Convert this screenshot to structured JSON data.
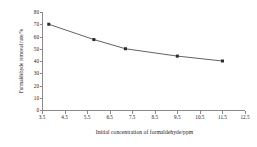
{
  "chart_data": {
    "type": "line",
    "title": "",
    "xlabel": "Initial concentration of formaldehyde/ppm",
    "ylabel": "Formaldehyde removal rate/%",
    "x": [
      3.8,
      5.8,
      7.2,
      9.5,
      11.5
    ],
    "values": [
      70,
      57.5,
      50,
      44,
      40
    ],
    "series": [
      {
        "name": "Formaldehyde removal rate",
        "x": [
          3.8,
          5.8,
          7.2,
          9.5,
          11.5
        ],
        "values": [
          70,
          57.5,
          50,
          44,
          40
        ]
      }
    ],
    "xlim": [
      3.5,
      12.5
    ],
    "ylim": [
      0,
      80
    ],
    "xticks": [
      "3.5",
      "4.5",
      "5.5",
      "6.5",
      "7.5",
      "8.5",
      "9.5",
      "10.5",
      "11.5",
      "12.5"
    ],
    "xtick_values": [
      3.5,
      4.5,
      5.5,
      6.5,
      7.5,
      8.5,
      9.5,
      10.5,
      11.5,
      12.5
    ],
    "yticks": [
      "0",
      "10",
      "20",
      "30",
      "40",
      "50",
      "60",
      "70",
      "80"
    ],
    "ytick_values": [
      0,
      10,
      20,
      30,
      40,
      50,
      60,
      70,
      80
    ],
    "grid": false,
    "legend": "none",
    "marker": "square",
    "line_color": "#3a3a3a",
    "marker_color": "#2a2a2a",
    "axis_color": "#8a8a8a",
    "background": "#ffffff"
  }
}
